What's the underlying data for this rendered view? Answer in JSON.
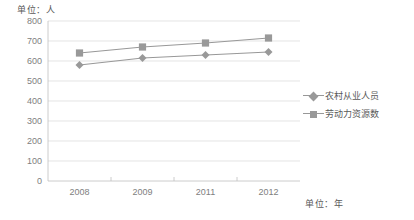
{
  "chart_data": {
    "type": "line",
    "title": "",
    "subtitle": "",
    "xlabel": "单位：年",
    "ylabel": "单位：人",
    "categories": [
      "2008",
      "2009",
      "2011",
      "2012"
    ],
    "x": [
      2008,
      2009,
      2011,
      2012
    ],
    "ylim": [
      0,
      800
    ],
    "ytick_labels": [
      "0",
      "100",
      "200",
      "300",
      "400",
      "500",
      "600",
      "700",
      "800"
    ],
    "ytick_values": [
      0,
      100,
      200,
      300,
      400,
      500,
      600,
      700,
      800
    ],
    "grid": true,
    "legend_position": "right",
    "series": [
      {
        "name": "农村从业人员",
        "marker": "diamond",
        "color": "#999999",
        "values": [
          580,
          615,
          630,
          645
        ]
      },
      {
        "name": "劳动力资源数",
        "marker": "square",
        "color": "#999999",
        "values": [
          640,
          670,
          690,
          715
        ]
      }
    ]
  },
  "axes": {
    "unit_y_label": "单位：人",
    "unit_x_label": "单位：年"
  },
  "legend": {
    "items": [
      {
        "label": "农村从业人员",
        "marker": "diamond-marker-icon"
      },
      {
        "label": "劳动力资源数",
        "marker": "square-marker-icon"
      }
    ]
  },
  "colors": {
    "series": "#999999",
    "gridline": "#d9d9d9",
    "axis": "#bfbfbf",
    "tick_text": "#808080",
    "label_text": "#595959",
    "background": "#ffffff"
  }
}
